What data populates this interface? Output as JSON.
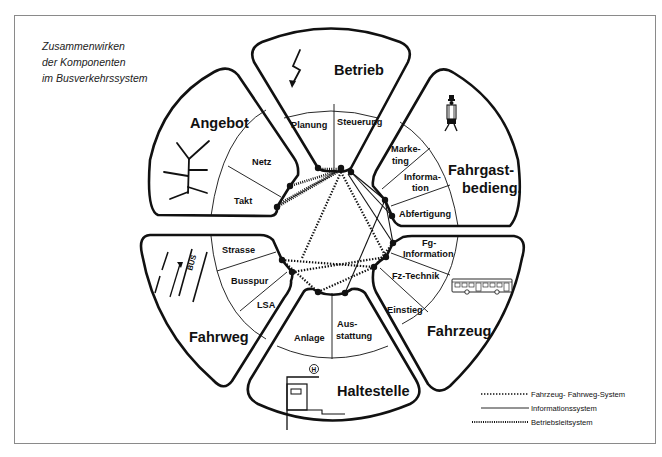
{
  "title": {
    "lines": [
      "Zusammenwirken",
      "der Komponenten",
      "im Busverkehrssystem"
    ]
  },
  "segments": {
    "betrieb": {
      "label": "Betrieb",
      "icon": "lightning-bolt-icon",
      "sub": [
        "Planung",
        "Steuerung"
      ]
    },
    "angebot": {
      "label": "Angebot",
      "icon": "network-tree-icon",
      "sub": [
        "Netz",
        "Takt"
      ]
    },
    "fahrgast": {
      "label_line1": "Fahrgast-",
      "label_line2": "bedieng.",
      "icon": "walking-passenger-icon",
      "sub": [
        {
          "l1": "Marke-",
          "l2": "ting"
        },
        {
          "l1": "Information",
          "l2": "tion"
        },
        {
          "l1": "Abfertigung"
        }
      ]
    },
    "fahrzeug": {
      "label": "Fahrzeug",
      "icon": "bus-icon",
      "sub": [
        {
          "l1": "Fg-",
          "l2": "Information"
        },
        {
          "l1": "Fz-Technik"
        },
        {
          "l1": "Einstieg"
        }
      ]
    },
    "haltestelle": {
      "label": "Haltestelle",
      "icon": "bus-stop-shelter-icon",
      "sub": [
        {
          "l1": "Anlage"
        },
        {
          "l1": "Aus-",
          "l2": "stattung"
        }
      ]
    },
    "fahrweg": {
      "label": "Fahrweg",
      "icon": "bus-lane-road-icon",
      "sub": [
        "Strasse",
        "Busspur",
        "LSA"
      ]
    }
  },
  "fahrgast_info": {
    "l1": "Informa-",
    "l2": "tion"
  },
  "bus_lane_text": "BUS",
  "stop_symbol": "H",
  "legend": {
    "items": [
      {
        "style": "dotted",
        "label": "Fahrzeug-  Fahrweg-System"
      },
      {
        "style": "solid",
        "label": "Informationssystem"
      },
      {
        "style": "dense-dotted",
        "label": "Betriebsleitsystem"
      }
    ]
  }
}
